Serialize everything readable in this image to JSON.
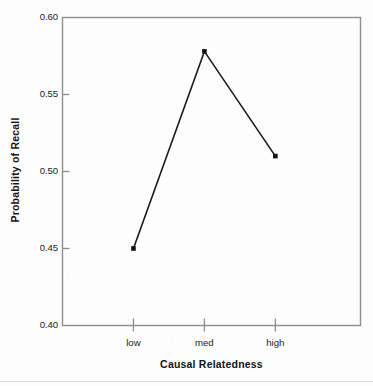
{
  "chart_data": {
    "type": "line",
    "title": "",
    "xlabel": "Causal Relatedness",
    "ylabel": "Probability of Recall",
    "categories": [
      "low",
      "med",
      "high"
    ],
    "values": [
      0.45,
      0.578,
      0.51
    ],
    "series": [
      {
        "name": "Probability of Recall",
        "values": [
          0.45,
          0.578,
          0.51
        ]
      }
    ],
    "ylim": [
      0.4,
      0.6
    ],
    "ytick_labels": [
      "0.60",
      "0.55",
      "0.50",
      "0.45",
      "0.40"
    ],
    "ytick_values": [
      0.6,
      0.55,
      0.5,
      0.45,
      0.4
    ],
    "xtick_labels": [
      "low",
      "med",
      "high"
    ],
    "grid": false,
    "legend": "none",
    "marker": "square",
    "line_color": "#1a1a1a",
    "marker_color": "#111111",
    "frame_color": "#8e8e8e",
    "background_color": "#fdfdfd"
  },
  "axis": {
    "y_title": "Probability of Recall",
    "x_title": "Causal Relatedness",
    "y_ticks": [
      {
        "label": "0.60",
        "value": 0.6
      },
      {
        "label": "0.55",
        "value": 0.55
      },
      {
        "label": "0.50",
        "value": 0.5
      },
      {
        "label": "0.45",
        "value": 0.45
      },
      {
        "label": "0.40",
        "value": 0.4
      }
    ],
    "x_ticks": [
      {
        "label": "low"
      },
      {
        "label": "med"
      },
      {
        "label": "high"
      }
    ]
  }
}
